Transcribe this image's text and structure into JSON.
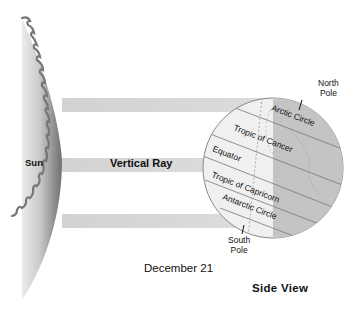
{
  "diagram": {
    "title": "December 21",
    "view": "Side View",
    "sun": {
      "label": "Sun",
      "color_light": "#e9e9e9",
      "color_dark": "#7a7a7a"
    },
    "rays": {
      "label": "Vertical Ray",
      "color": "#d6d6d6",
      "bands": [
        {
          "name": "top-ray",
          "y": 98
        },
        {
          "name": "vertical-ray",
          "y": 158
        },
        {
          "name": "bottom-ray",
          "y": 214
        }
      ]
    },
    "globe": {
      "day_color": "#f0f0f0",
      "night_color": "#c4c4c4",
      "lines": [
        {
          "label": "Arctic Circle"
        },
        {
          "label": "Tropic of Cancer"
        },
        {
          "label": "Equator"
        },
        {
          "label": "Tropic of Capricorn"
        },
        {
          "label": "Antarctic Circle"
        }
      ],
      "north_pole": {
        "line1": "North",
        "line2": "Pole"
      },
      "south_pole": {
        "line1": "South",
        "line2": "Pole"
      }
    }
  }
}
